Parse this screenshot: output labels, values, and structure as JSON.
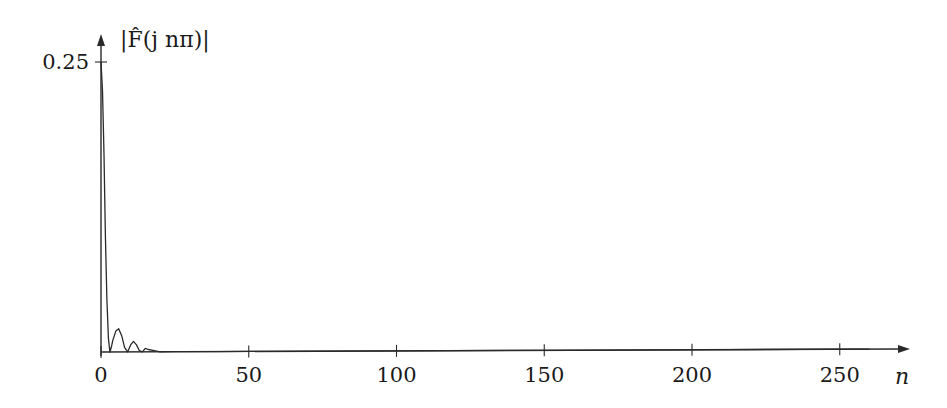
{
  "chart_data": {
    "type": "line",
    "title": "",
    "xlabel": "n",
    "ylabel": "|F̂(j nπ)|",
    "xlim": [
      0,
      270
    ],
    "ylim": [
      0,
      0.28
    ],
    "x_ticks": [
      0,
      50,
      100,
      150,
      200,
      250
    ],
    "x_tick_labels": [
      "0",
      "50",
      "100",
      "150",
      "200",
      "250"
    ],
    "y_ticks": [
      0.25
    ],
    "y_tick_labels": [
      "0.25"
    ],
    "grid": false,
    "legend": null,
    "series": [
      {
        "name": "|F̂(j nπ)|",
        "x": [
          0,
          0.5,
          1,
          1.5,
          2,
          2.5,
          3,
          3.5,
          4,
          5,
          6,
          7,
          8,
          9,
          10,
          11,
          12,
          13,
          14,
          15,
          16,
          18,
          20,
          25,
          30,
          40,
          50,
          75,
          100,
          150,
          200,
          250,
          260
        ],
        "values": [
          0.25,
          0.225,
          0.17,
          0.1,
          0.045,
          0.012,
          0.0,
          0.004,
          0.01,
          0.018,
          0.02,
          0.014,
          0.004,
          0.0,
          0.006,
          0.009,
          0.006,
          0.001,
          0.0,
          0.003,
          0.002,
          0.001,
          0.0,
          0.0,
          0.0,
          0.0,
          0.0,
          0.0,
          0.0,
          0.0,
          0.0,
          0.0,
          0.0
        ]
      }
    ]
  },
  "layout": {
    "origin_px": [
      101,
      352
    ],
    "px_per_x_unit": 2.955,
    "y_tick_px": 62,
    "y_tick_value": 0.25,
    "x_axis_end_px": 910,
    "y_axis_top_px": 34,
    "line_color": "#2a2a2a"
  }
}
